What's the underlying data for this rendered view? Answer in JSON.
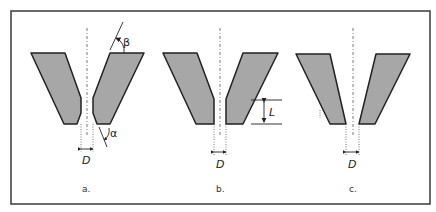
{
  "figure": {
    "panels": [
      {
        "id": "a",
        "caption": "a.",
        "dimension_label": "D",
        "angle_labels": {
          "top": "β",
          "bottom": "α"
        }
      },
      {
        "id": "b",
        "caption": "b.",
        "dimension_label": "D",
        "length_label": "L"
      },
      {
        "id": "c",
        "caption": "c.",
        "dimension_label": "D"
      }
    ],
    "colors": {
      "fill": "#a7a7a7",
      "stroke": "#222222",
      "frame": "#3a3a3a"
    }
  }
}
